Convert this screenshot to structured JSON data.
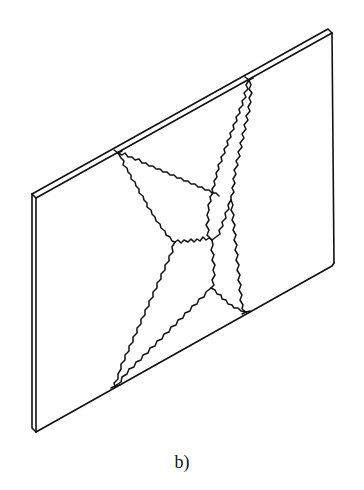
{
  "figure": {
    "caption": "b)",
    "stroke_color": "#111111",
    "background_color": "#ffffff",
    "plate": {
      "front_face": [
        [
          36,
          198
        ],
        [
          332,
          33
        ],
        [
          334,
          263
        ],
        [
          36,
          432
        ]
      ],
      "thickness_offset": [
        -4,
        4
      ]
    },
    "crack_origins": {
      "top_left": [
        118,
        153
      ],
      "top_right": [
        249,
        80
      ],
      "bottom_left": [
        115,
        386
      ],
      "bottom_right": [
        246,
        312
      ]
    },
    "crack_junctions": [
      [
        219,
        196
      ],
      [
        231,
        200
      ],
      [
        175,
        242
      ],
      [
        212,
        240
      ],
      [
        211,
        288
      ]
    ]
  }
}
